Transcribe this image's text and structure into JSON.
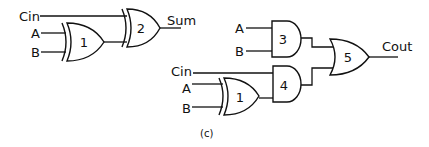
{
  "diagram": {
    "type": "logic-circuit",
    "caption": "(c)",
    "left_circuit": {
      "name": "sum-circuit",
      "inputs": {
        "cin": "Cin",
        "a": "A",
        "b": "B"
      },
      "gates": [
        {
          "id": "1",
          "kind": "XOR",
          "label": "1",
          "inputs": [
            "A",
            "B"
          ]
        },
        {
          "id": "2",
          "kind": "XOR",
          "label": "2",
          "inputs": [
            "Cin",
            "gate1"
          ]
        }
      ],
      "output": "Sum"
    },
    "right_circuit": {
      "name": "carry-circuit",
      "inputs": {
        "a_top": "A",
        "b_top": "B",
        "cin": "Cin",
        "a_bottom": "A",
        "b_bottom": "B"
      },
      "gates": [
        {
          "id": "3",
          "kind": "AND",
          "label": "3",
          "inputs": [
            "A",
            "B"
          ]
        },
        {
          "id": "1b",
          "kind": "XOR",
          "label": "1",
          "inputs": [
            "A",
            "B"
          ]
        },
        {
          "id": "4",
          "kind": "AND",
          "label": "4",
          "inputs": [
            "Cin",
            "gate1"
          ]
        },
        {
          "id": "5",
          "kind": "OR",
          "label": "5",
          "inputs": [
            "gate3",
            "gate4"
          ]
        }
      ],
      "output": "Cout"
    }
  }
}
